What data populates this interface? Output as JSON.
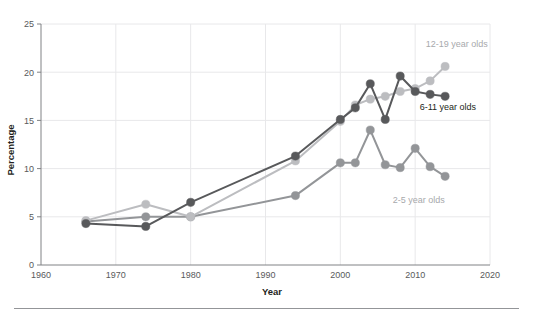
{
  "chart_data": {
    "type": "line",
    "title": "",
    "subtitle": "",
    "xlabel": "Year",
    "ylabel": "Percentage",
    "xlim": [
      1960,
      2020
    ],
    "ylim": [
      0,
      25
    ],
    "xticks": [
      1960,
      1970,
      1980,
      1990,
      2000,
      2010,
      2020
    ],
    "xtick_labels": [
      "1960",
      "1970",
      "1980",
      "1990",
      "2000",
      "2010",
      "2020"
    ],
    "yticks": [
      0,
      5,
      10,
      15,
      20,
      25
    ],
    "ytick_labels": [
      "0",
      "5",
      "10",
      "15",
      "20",
      "25"
    ],
    "grid": true,
    "grid_axis": "both",
    "legend_position": "inline-right-of-series",
    "markers": true,
    "series": [
      {
        "name": "12-19 year olds",
        "label": "12-19 year olds",
        "color": "#bcbdc0",
        "label_color": "#a7a9ac",
        "label_x": 2011.4,
        "label_y": 22.6,
        "x": [
          1966,
          1974,
          1980,
          1994,
          2000,
          2002,
          2004,
          2006,
          2008,
          2010,
          2012,
          2014
        ],
        "y": [
          4.6,
          6.3,
          5.0,
          10.8,
          14.9,
          16.6,
          17.2,
          17.5,
          18.0,
          18.3,
          19.1,
          20.6
        ]
      },
      {
        "name": "6-11 year olds",
        "label": "6-11 year olds",
        "color": "#58595b",
        "label_color": "#231f20",
        "label_x": 2010.6,
        "label_y": 16.1,
        "x": [
          1966,
          1974,
          1980,
          1994,
          2000,
          2002,
          2004,
          2006,
          2008,
          2010,
          2012,
          2014
        ],
        "y": [
          4.3,
          4.0,
          6.5,
          11.3,
          15.1,
          16.3,
          18.8,
          15.1,
          19.6,
          18.0,
          17.7,
          17.5
        ]
      },
      {
        "name": "2-5 year olds",
        "label": "2-5 year olds",
        "color": "#939598",
        "label_color": "#a7a9ac",
        "label_x": 2007.0,
        "label_y": 6.4,
        "x": [
          1966,
          1974,
          1980,
          1994,
          2000,
          2002,
          2004,
          2006,
          2008,
          2010,
          2012,
          2014
        ],
        "y": [
          4.5,
          5.0,
          5.0,
          7.2,
          10.6,
          10.6,
          14.0,
          10.4,
          10.1,
          12.1,
          10.2,
          9.2
        ]
      }
    ]
  },
  "axes": {
    "x_title": "Year",
    "y_title": "Percentage"
  }
}
